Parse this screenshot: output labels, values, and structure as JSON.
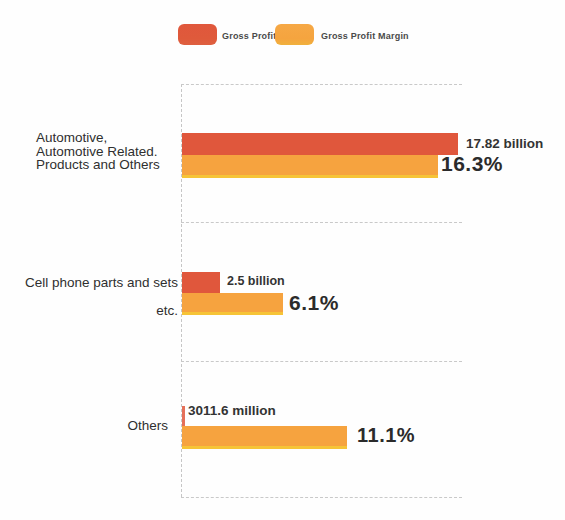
{
  "legend": {
    "items": [
      {
        "label": "Gross Profit",
        "color": "#e0573c"
      },
      {
        "label": "Gross Profit Margin",
        "color": "#f5a43f"
      }
    ]
  },
  "chart_data": {
    "type": "bar",
    "orientation": "horizontal",
    "categories": [
      "Automotive, Automotive Related. Products and Others",
      "Cell phone parts and sets etc.",
      "Others"
    ],
    "series": [
      {
        "name": "Gross Profit",
        "color": "#e0573c",
        "values_billion": [
          17.82,
          2.5,
          3.0116
        ],
        "labels": [
          "17.82 billion",
          "2.5 billion",
          "3011.6 million"
        ]
      },
      {
        "name": "Gross Profit Margin",
        "color": "#f5a43f",
        "values_percent": [
          16.3,
          6.1,
          11.1
        ],
        "labels": [
          "16.3%",
          "6.1%",
          "11.1%"
        ]
      }
    ],
    "legend_position": "top",
    "grid": "dashed horizontal band separators with dashed left axis"
  },
  "rows": [
    {
      "label": "Automotive,\nAutomotive Related.\nProducts and Others",
      "profit_label": "17.82 billion",
      "margin_label": "16.3%"
    },
    {
      "label": "Cell phone parts and sets\netc.",
      "profit_label": "2.5 billion",
      "margin_label": "6.1%"
    },
    {
      "label": "Others",
      "profit_label": "3011.6 million",
      "margin_label": "11.1%"
    }
  ]
}
